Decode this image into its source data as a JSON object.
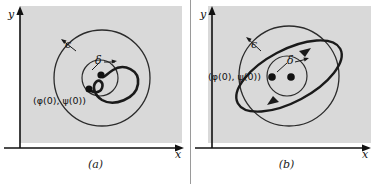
{
  "figure": {
    "type": "two-panel-math-diagram",
    "topic": "Lyapunov stability and orbital stability of solutions",
    "background_color": "#ffffff",
    "panel_fill_color": "#d9d9d9",
    "curve_color": "#1a1a1a",
    "axis_color": "#111111"
  },
  "panels": [
    {
      "id": "a",
      "caption": "(a)",
      "axes": {
        "x_label": "x",
        "y_label": "y"
      },
      "labels": {
        "epsilon": "ϵ",
        "delta": "δ",
        "initial_point": "(φ(0), ψ(0))"
      },
      "description": "Trajectory spiraling inward toward the equilibrium point inside the delta circle",
      "geometry": {
        "epsilon_circle": {
          "cx": 102,
          "cy": 78,
          "r": 48
        },
        "delta_circle": {
          "cx": 100,
          "cy": 78,
          "r": 18
        },
        "equilibrium_point": {
          "cx": 101,
          "cy": 75
        },
        "initial_point": {
          "cx": 89,
          "cy": 89
        }
      }
    },
    {
      "id": "b",
      "caption": "(b)",
      "axes": {
        "x_label": "x",
        "y_label": "y"
      },
      "labels": {
        "epsilon": "ϵ",
        "delta": "δ",
        "initial_point": "(φ(0), ψ(0))"
      },
      "description": "Closed elliptical periodic orbit passing through the initial point, contained in the epsilon circle",
      "geometry": {
        "epsilon_circle": {
          "cx": 98,
          "cy": 76,
          "r": 50
        },
        "delta_circle": {
          "cx": 96,
          "cy": 76,
          "r": 20
        },
        "equilibrium_point": {
          "cx": 100,
          "cy": 77
        },
        "initial_point": {
          "cx": 81,
          "cy": 77
        },
        "orbit_ellipse": {
          "cx": 98,
          "cy": 76,
          "rx": 58,
          "ry": 26,
          "rotation_deg": -28
        }
      }
    }
  ]
}
